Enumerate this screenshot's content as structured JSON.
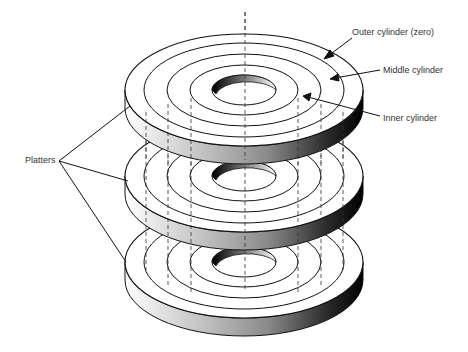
{
  "diagram": {
    "type": "disk-platter-cylinders",
    "labels": {
      "outer": "Outer cylinder (zero)",
      "middle": "Middle cylinder",
      "inner": "Inner cylinder",
      "platters": "Platters"
    },
    "platter_count": 3,
    "tracks_per_surface": 4,
    "colors": {
      "line": "#111111",
      "surface": "#ffffff",
      "edge_light": "#f4f4f4",
      "edge_dark": "#000000",
      "label": "#333333"
    }
  }
}
